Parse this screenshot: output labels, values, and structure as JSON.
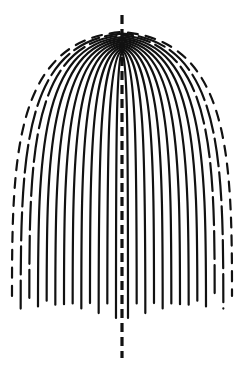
{
  "diagram": {
    "type": "nested-arch-lines",
    "line_color": "#111111",
    "background_color": "#ffffff",
    "arch_count": 13,
    "axis": {
      "style": "dashed",
      "orientation": "vertical"
    },
    "has_text": false
  }
}
